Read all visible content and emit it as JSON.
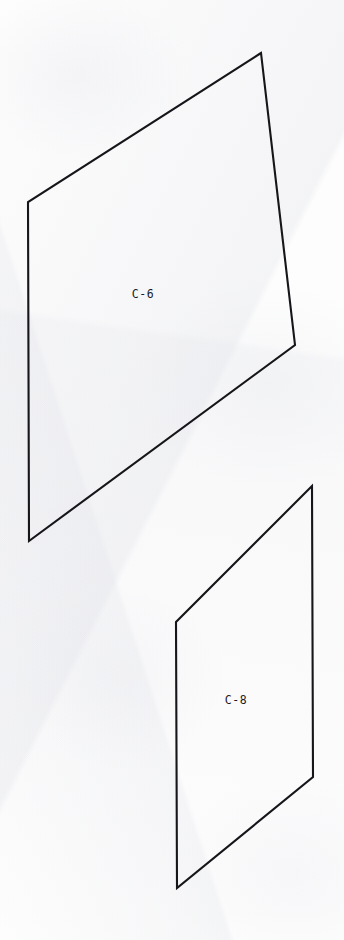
{
  "sheet": {
    "background_color": "#fdfdfd",
    "width": 344,
    "height": 940,
    "media": "scanned-paper",
    "line_color": "#16161a",
    "line_width": 2.1,
    "label_color": "#1b1b1f"
  },
  "panels": [
    {
      "id": "panel-c6",
      "label": "C-6",
      "label_position": {
        "x": 143,
        "y": 294
      },
      "shape": "quadrilateral",
      "points": "261,53 28,202 29,541 295,345",
      "vertices": [
        {
          "name": "top",
          "x": 261,
          "y": 53
        },
        {
          "name": "upper-left",
          "x": 28,
          "y": 202
        },
        {
          "name": "lower-left",
          "x": 29,
          "y": 541
        },
        {
          "name": "right",
          "x": 295,
          "y": 345
        }
      ]
    },
    {
      "id": "panel-c8",
      "label": "C-8",
      "label_position": {
        "x": 236,
        "y": 700
      },
      "shape": "quadrilateral",
      "points": "312,486 176,622 177,888 313,777",
      "vertices": [
        {
          "name": "top",
          "x": 312,
          "y": 486
        },
        {
          "name": "upper-left",
          "x": 176,
          "y": 622
        },
        {
          "name": "lower-left",
          "x": 177,
          "y": 888
        },
        {
          "name": "right",
          "x": 313,
          "y": 777
        }
      ]
    }
  ]
}
